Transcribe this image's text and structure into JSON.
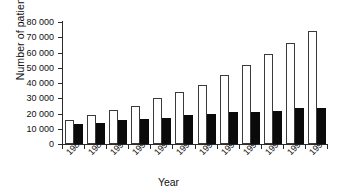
{
  "chart_data": {
    "type": "bar",
    "title": "",
    "subtitle": "",
    "xlabel": "Year",
    "ylabel": "Number of patients",
    "ylim": [
      0,
      80000
    ],
    "ytick_step": 10000,
    "ytick_labels": [
      "80 000",
      "70 000",
      "60 000",
      "50 000",
      "40 000",
      "30 000",
      "20 000",
      "10 000",
      "0"
    ],
    "ytick_values": [
      80000,
      70000,
      60000,
      50000,
      40000,
      30000,
      20000,
      10000,
      0
    ],
    "grid": false,
    "legend": "none",
    "categories": [
      "1988",
      "1989",
      "1990",
      "1991",
      "1992",
      "1993",
      "1994",
      "1995",
      "1996",
      "1997",
      "1998",
      "1999"
    ],
    "series": [
      {
        "name": "white-bar-series",
        "fill": "#ffffff",
        "edge": "#3a3a3a",
        "values": [
          16000,
          19200,
          22500,
          25200,
          30300,
          34200,
          38800,
          45400,
          51500,
          58800,
          66300,
          73800
        ]
      },
      {
        "name": "black-bar-series",
        "fill": "#0a0a0a",
        "edge": "#0a0a0a",
        "values": [
          12900,
          13700,
          15800,
          16100,
          16800,
          18700,
          19400,
          21000,
          21300,
          21600,
          23400,
          23400
        ]
      }
    ]
  },
  "axes": {
    "y_title": "Number of patients",
    "x_title": "Year"
  }
}
